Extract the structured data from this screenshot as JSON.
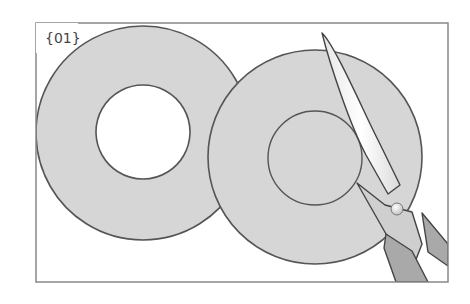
{
  "figure": {
    "step_label": "{01}",
    "colors": {
      "paper_fill": "#d6d6d6",
      "outline": "#555555",
      "frame": "#888888",
      "scissor_handle": "#a9a9a9",
      "scissor_blade": "#f2f2f2",
      "background": "#ffffff"
    }
  }
}
